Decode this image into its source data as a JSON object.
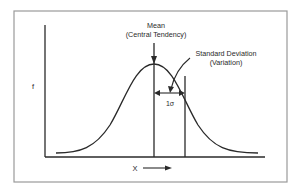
{
  "diagram": {
    "type": "normal-distribution",
    "y_axis_label": "f",
    "x_axis_label": "X",
    "mean_label_line1": "Mean",
    "mean_label_line2": "(Central Tendency)",
    "sd_label_line1": "Standard Deviation",
    "sd_label_line2": "(Variation)",
    "sigma_label": "1σ",
    "colors": {
      "line": "#2a2a2a",
      "frame": "#9a9a9a",
      "background": "#ffffff"
    }
  }
}
